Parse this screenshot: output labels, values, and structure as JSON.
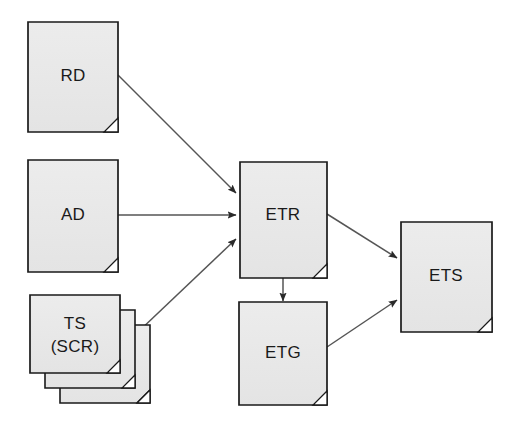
{
  "diagram": {
    "type": "document-flow-diagram",
    "background_color": "#ffffff",
    "node_fill": "#e8e8e8",
    "node_stroke": "#1a1a1a",
    "arrow_color": "#3a3a3a",
    "nodes": [
      {
        "id": "rd",
        "label": "RD",
        "shape": "document",
        "stacked": false,
        "x": 28,
        "y": 22,
        "w": 90,
        "h": 110
      },
      {
        "id": "ad",
        "label": "AD",
        "shape": "document",
        "stacked": false,
        "x": 28,
        "y": 160,
        "w": 90,
        "h": 112
      },
      {
        "id": "ts",
        "label_line1": "TS",
        "label_line2": "(SCR)",
        "label": "TS (SCR)",
        "shape": "document",
        "stacked": true,
        "stack_count": 3,
        "x": 30,
        "y": 295,
        "w": 90,
        "h": 95
      },
      {
        "id": "etr",
        "label": "ETR",
        "shape": "document",
        "stacked": false,
        "x": 240,
        "y": 162,
        "w": 87,
        "h": 116
      },
      {
        "id": "etg",
        "label": "ETG",
        "shape": "document",
        "stacked": false,
        "x": 239,
        "y": 302,
        "w": 88,
        "h": 103
      },
      {
        "id": "ets",
        "label": "ETS",
        "shape": "document",
        "stacked": false,
        "x": 401,
        "y": 222,
        "w": 91,
        "h": 110
      }
    ],
    "edges": [
      {
        "id": "rd-etr",
        "from": "rd",
        "to": "etr",
        "x1": 118,
        "y1": 75,
        "x2": 238,
        "y2": 194
      },
      {
        "id": "ad-etr",
        "from": "ad",
        "to": "etr",
        "x1": 118,
        "y1": 215,
        "x2": 238,
        "y2": 215
      },
      {
        "id": "ts-etr",
        "from": "ts",
        "to": "etr",
        "x1": 137,
        "y1": 333,
        "x2": 238,
        "y2": 238
      },
      {
        "id": "etr-ets",
        "from": "etr",
        "to": "ets",
        "x1": 327,
        "y1": 214,
        "x2": 399,
        "y2": 259
      },
      {
        "id": "etr-etg",
        "from": "etr",
        "to": "etg",
        "x1": 283,
        "y1": 278,
        "x2": 283,
        "y2": 300
      },
      {
        "id": "etg-ets",
        "from": "etg",
        "to": "ets",
        "x1": 327,
        "y1": 347,
        "x2": 399,
        "y2": 300
      }
    ]
  }
}
